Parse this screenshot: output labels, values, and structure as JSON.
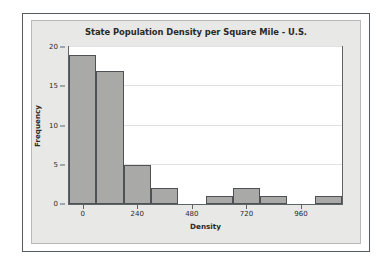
{
  "chart_data": {
    "type": "bar",
    "title": "State Population Density per Square Mile - U.S.",
    "xlabel": "Density",
    "ylabel": "Frequency",
    "ylim": [
      0,
      20
    ],
    "xlim": [
      -60,
      1140
    ],
    "grid": true,
    "legend": "none",
    "bin_width": 120,
    "y_ticks": [
      0,
      5,
      10,
      15,
      20
    ],
    "y_tick_labels": [
      "0",
      "5",
      "10",
      "15",
      "20"
    ],
    "x_ticks": [
      0,
      240,
      480,
      720,
      960
    ],
    "x_tick_labels": [
      "0",
      "240",
      "480",
      "720",
      "960"
    ],
    "bin_starts": [
      -60,
      60,
      180,
      300,
      420,
      540,
      660,
      780,
      900,
      1020
    ],
    "bin_ends": [
      60,
      180,
      300,
      420,
      540,
      660,
      780,
      900,
      1020,
      1140
    ],
    "categories": [
      "-60 to 60",
      "60 to 180",
      "180 to 300",
      "300 to 420",
      "420 to 540",
      "540 to 660",
      "660 to 780",
      "780 to 900",
      "900 to 1020",
      "1020 to 1140"
    ],
    "values": [
      19,
      17,
      5,
      2,
      0,
      1,
      2,
      1,
      0,
      1
    ],
    "bar_color": "#a9a9a8",
    "bar_edge_color": "#4e5255",
    "plot_background": "#ffffff",
    "panel_background": "#e8e8e6",
    "grid_color": "#e2e2e2",
    "axis_color": "#5e6366",
    "text_color": "#2b2b2b"
  }
}
